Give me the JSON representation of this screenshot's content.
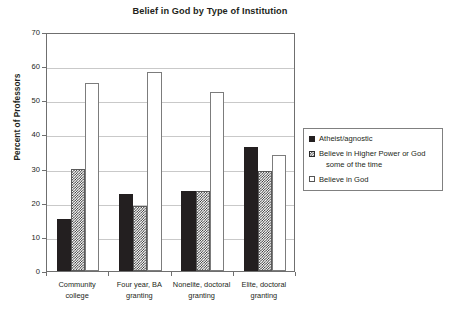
{
  "chart_data": {
    "type": "bar",
    "title": "Belief in God by Type of Institution",
    "xlabel": "",
    "ylabel": "Percent of Professors",
    "ylim": [
      0,
      70
    ],
    "ytick_step": 10,
    "yticks": [
      0,
      10,
      20,
      30,
      40,
      50,
      60,
      70
    ],
    "grid": true,
    "legend_position": "right",
    "categories": [
      "Community college",
      "Four year, BA granting",
      "Nonelite, doctoral granting",
      "Elite, doctoral granting"
    ],
    "category_lines": [
      [
        "Community",
        "college"
      ],
      [
        "Four year, BA",
        "granting"
      ],
      [
        "Nonelite, doctoral",
        "granting"
      ],
      [
        "Elite, doctoral",
        "granting"
      ]
    ],
    "series": [
      {
        "name": "Atheist/agnostic",
        "pattern": "solid-black",
        "values": [
          15.3,
          22.6,
          23.3,
          36.4
        ]
      },
      {
        "name": "Believe in Higher Power or God some of the time",
        "name_lines": [
          "Believe in Higher Power or God",
          "some of the time"
        ],
        "pattern": "checkered",
        "values": [
          29.9,
          19.0,
          23.5,
          29.4
        ]
      },
      {
        "name": "Believe in God",
        "pattern": "white-outline",
        "values": [
          55.0,
          58.3,
          52.5,
          34.0
        ]
      }
    ]
  },
  "colors": {
    "series_solid": "#231f20",
    "series_checker": "#2b2b2b",
    "series_white": "#ffffff",
    "axis": "#6f6f6f",
    "grid": "#c9c9c9",
    "text": "#231f20"
  },
  "footer": {
    "partial_text": ""
  }
}
